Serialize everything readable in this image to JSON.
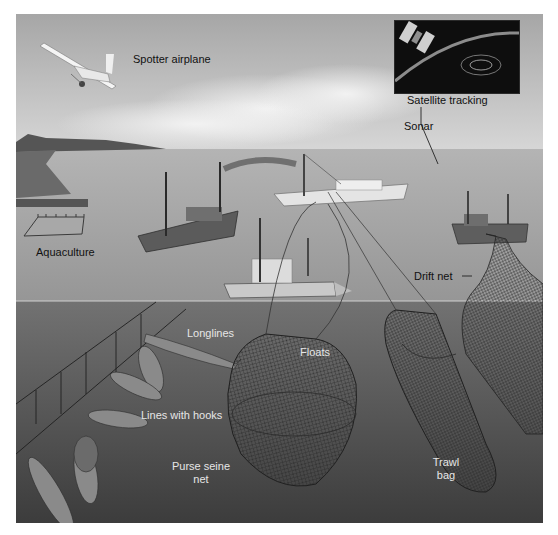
{
  "figure": {
    "colors": {
      "sky_top": "#a9a9a9",
      "sky_bottom": "#d2d2d2",
      "sea_surface": "#9a9a9a",
      "underwater_top": "#6f6f6f",
      "underwater_bottom": "#3e3e3e",
      "label_dark": "#111111",
      "label_light": "#e6e6e6"
    },
    "labels": {
      "spotter_airplane": "Spotter airplane",
      "satellite_tracking": "Satellite tracking",
      "sonar": "Sonar",
      "aquaculture": "Aquaculture",
      "drift_net": "Drift net",
      "longlines": "Longlines",
      "floats": "Floats",
      "lines_with_hooks": "Lines with hooks",
      "purse_seine_net_line1": "Purse seine",
      "purse_seine_net_line2": "net",
      "trawl_bag_line1": "Trawl",
      "trawl_bag_line2": "bag"
    }
  }
}
